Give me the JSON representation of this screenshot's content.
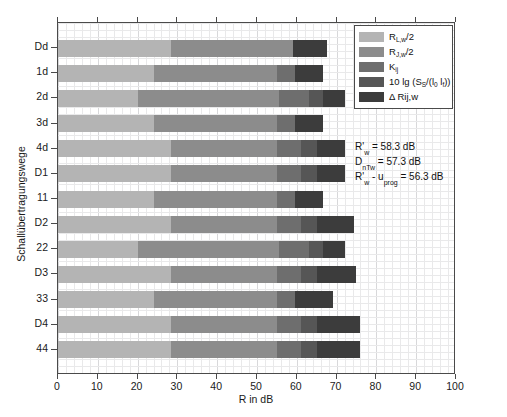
{
  "chart_data": {
    "type": "bar",
    "orientation": "horizontal",
    "stacked": true,
    "title": "",
    "xlabel": "R in dB",
    "ylabel": "Schallübertragungswege",
    "xlim": [
      0,
      100
    ],
    "ylim_categories_count": 13,
    "xticks": [
      "0",
      "10",
      "20",
      "30",
      "40",
      "50",
      "60",
      "70",
      "80",
      "90",
      "100"
    ],
    "grid": true,
    "legend_position": "top-right",
    "categories": [
      "Dd",
      "1d",
      "2d",
      "3d",
      "4d",
      "D1",
      "11",
      "D2",
      "22",
      "D3",
      "33",
      "D4",
      "44"
    ],
    "series": [
      {
        "name": "R_Lw/2",
        "label": "Rₗ,w/2",
        "color": "#b4b4b4",
        "values": [
          28.5,
          24.0,
          20.0,
          24.0,
          28.5,
          28.5,
          24.0,
          28.5,
          20.0,
          28.5,
          24.0,
          28.5,
          28.5
        ]
      },
      {
        "name": "R_jw/2",
        "label": "Rⱼ,w/2",
        "color": "#8c8c8c",
        "values": [
          30.5,
          31.0,
          35.5,
          31.0,
          26.5,
          26.5,
          31.0,
          26.5,
          35.5,
          26.5,
          31.0,
          26.5,
          26.5
        ]
      },
      {
        "name": "K_ij",
        "label": "Kᵢⱼ",
        "color": "#6e6e6e",
        "values": [
          0.0,
          4.5,
          7.5,
          4.5,
          6.0,
          6.0,
          4.5,
          6.0,
          7.5,
          6.0,
          4.5,
          6.0,
          6.0
        ]
      },
      {
        "name": "10 lg (S_S/(l_0 l_f))",
        "label": "10 lg (Sₛ/(l₀ lƒ))",
        "color": "#565656",
        "values": [
          0.0,
          0.0,
          3.5,
          0.0,
          4.0,
          4.0,
          0.0,
          4.0,
          3.5,
          4.0,
          0.0,
          4.0,
          4.0
        ]
      },
      {
        "name": "Delta Rij,w",
        "label": "Δ Rij,w",
        "color": "#3c3c3c",
        "values": [
          8.5,
          7.0,
          5.5,
          7.0,
          7.0,
          7.0,
          7.0,
          9.5,
          5.5,
          10.0,
          9.5,
          11.0,
          11.0
        ]
      }
    ],
    "totals": [
      67.5,
      66.5,
      72.0,
      66.5,
      72.0,
      72.0,
      66.5,
      74.5,
      72.0,
      75.0,
      69.0,
      76.0,
      76.0
    ],
    "annotations": [
      {
        "id": "rw",
        "text": "R'w = 58.3 dB",
        "symbol": "R'",
        "sub": "w",
        "value": "58.3",
        "unit": "dB"
      },
      {
        "id": "dntw",
        "text": "DnTw = 57.3 dB",
        "symbol": "D",
        "sub": "nTw",
        "value": "57.3",
        "unit": "dB"
      },
      {
        "id": "rw-uprog",
        "text": "R'w - uprog = 56.3 dB",
        "symbol": "R'",
        "sub": "w",
        "sub2": "prog",
        "value": "56.3",
        "unit": "dB"
      }
    ]
  },
  "axes": {
    "x": {
      "title": "R in dB",
      "ticks": [
        "0",
        "10",
        "20",
        "30",
        "40",
        "50",
        "60",
        "70",
        "80",
        "90",
        "100"
      ]
    },
    "y": {
      "title": "Schallübertragungswege",
      "ticks": [
        "Dd",
        "1d",
        "2d",
        "3d",
        "4d",
        "D1",
        "11",
        "D2",
        "22",
        "D3",
        "33",
        "D4",
        "44"
      ]
    }
  },
  "legend": {
    "items": [
      {
        "label": "Rₗ,w/2",
        "base": "R",
        "sub": "L,w",
        "suffix": "/2",
        "color": "#b4b4b4"
      },
      {
        "label": "Rⱼ,w/2",
        "base": "R",
        "sub": "J,w",
        "suffix": "/2",
        "color": "#8c8c8c"
      },
      {
        "label": "Kᵢⱼ",
        "base": "K",
        "sub": "ij",
        "suffix": "",
        "color": "#6e6e6e"
      },
      {
        "label": "10 lg (Sₛ/(l₀ lƒ))",
        "base": "10 lg (S",
        "sub": "S",
        "suffix": "/(l",
        "color": "#565656"
      },
      {
        "label": "Δ Rij,w",
        "base": "Δ Rij,w",
        "sub": "",
        "suffix": "",
        "color": "#3c3c3c"
      }
    ]
  },
  "annotation_block": {
    "line1_symbol": "R'",
    "line1_sub": "w",
    "line1_rest": "= 58.3 dB",
    "line2_symbol": "D",
    "line2_sub": "nTw",
    "line2_rest": "= 57.3 dB",
    "line3_symbol": "R'",
    "line3_sub": "w",
    "line3_mid": "- u",
    "line3_sub2": "prog",
    "line3_rest": "= 56.3 dB"
  },
  "caption": {
    "text": ""
  },
  "colors": {
    "series_1": "#b4b4b4",
    "series_2": "#8c8c8c",
    "series_3": "#6e6e6e",
    "series_4": "#565656",
    "series_5": "#3c3c3c",
    "axis": "#4a4a4a",
    "grid": "#e9e9ea",
    "background": "#ffffff"
  }
}
